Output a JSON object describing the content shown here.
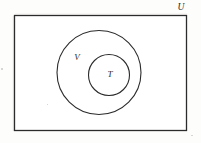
{
  "figure": {
    "kind": "venn-diagram",
    "background_color": "#fdfdfc",
    "stroke_color": "#2b2b2b",
    "fill_color": "#ffffff",
    "labels": {
      "universe": "U",
      "outer_set": "V",
      "inner_set": "T"
    },
    "shapes": {
      "universe_rect": {
        "name": "U",
        "x": 14.5,
        "y": 15.5,
        "width": 172,
        "height": 115,
        "stroke_width": 1.3
      },
      "outer_circle": {
        "name": "V",
        "cx": 99,
        "cy": 72.5,
        "r": 42,
        "stroke_width": 1.1
      },
      "inner_circle": {
        "name": "T",
        "cx": 109,
        "cy": 75,
        "r": 20.5,
        "stroke_width": 1.1
      }
    },
    "label_positions": {
      "universe": {
        "x": 181,
        "y": 7.5
      },
      "outer_set": {
        "x": 77,
        "y": 58
      },
      "inner_set": {
        "x": 110,
        "y": 75
      }
    }
  }
}
